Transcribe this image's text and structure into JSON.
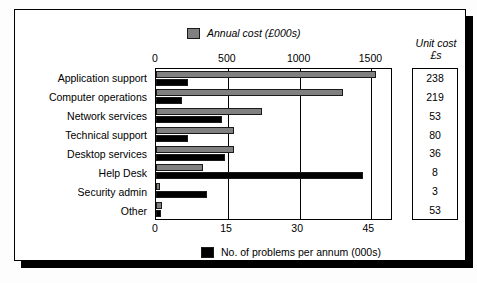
{
  "legend": {
    "top": {
      "label": "Annual cost (£000s)",
      "icon": "gray-square-swatch",
      "color": "#808080"
    },
    "bottom": {
      "label": "No. of problems per annum (000s)",
      "icon": "black-square-swatch",
      "color": "#000000"
    }
  },
  "unit_cost_panel": {
    "header_line1": "Unit cost",
    "header_line2": "£s",
    "values": [
      "238",
      "219",
      "53",
      "80",
      "36",
      "8",
      "3",
      "53"
    ]
  },
  "chart_data": {
    "type": "bar",
    "orientation": "horizontal",
    "title": "",
    "grid": true,
    "legend_position": "top-and-bottom",
    "categories": [
      "Application support",
      "Computer operations",
      "Network services",
      "Technical support",
      "Desktop services",
      "Help Desk",
      "Security admin",
      "Other"
    ],
    "series": [
      {
        "name": "Annual cost (£000s)",
        "axis": "top",
        "color": "#808080",
        "values": [
          1530,
          1300,
          740,
          540,
          545,
          330,
          30,
          45
        ],
        "axis_label": "Annual cost (£000s)",
        "ticks": [
          0,
          500,
          1000,
          1500
        ],
        "lim": [
          0,
          1650
        ]
      },
      {
        "name": "No. of problems per annum (000s)",
        "axis": "bottom",
        "color": "#000000",
        "values": [
          6.7,
          5.5,
          13.9,
          6.7,
          14.6,
          43.6,
          10.8,
          1.0
        ],
        "axis_label": "No. of problems per annum (000s)",
        "ticks": [
          0,
          15,
          30,
          45
        ],
        "lim": [
          0,
          50
        ]
      }
    ],
    "top_axis": {
      "ticks": [
        "0",
        "500",
        "1000",
        "1500"
      ],
      "values": [
        0,
        500,
        1000,
        1500
      ],
      "max": 1650
    },
    "bottom_axis": {
      "ticks": [
        "0",
        "15",
        "30",
        "45"
      ],
      "values": [
        0,
        15,
        30,
        45
      ],
      "max": 50
    },
    "unit_cost_column": {
      "header": "Unit cost £s",
      "values": [
        238,
        219,
        53,
        80,
        36,
        8,
        3,
        53
      ]
    }
  }
}
